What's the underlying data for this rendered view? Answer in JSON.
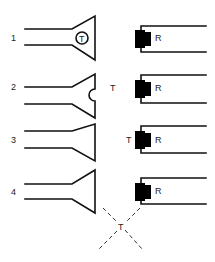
{
  "diagram": {
    "colors": {
      "line": "#111111",
      "fill": "#000000",
      "background": "#ffffff"
    },
    "rows": [
      {
        "number": "1",
        "transmitter_label": "T",
        "transmitter_position": "inside-horn-circle",
        "receiver_label": "R"
      },
      {
        "number": "2",
        "transmitter_label": "T",
        "transmitter_position": "between",
        "receiver_label": "R"
      },
      {
        "number": "3",
        "transmitter_label": "T",
        "transmitter_position": "at-receiver",
        "receiver_label": "R"
      },
      {
        "number": "4",
        "transmitter_label": "T",
        "transmitter_position": "offset-diagonal",
        "receiver_label": "R"
      }
    ]
  }
}
